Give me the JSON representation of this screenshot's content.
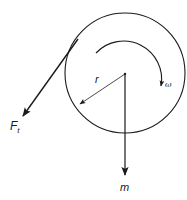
{
  "diagram": {
    "type": "free-body diagram of rotating pulley",
    "colors": {
      "stroke": "#1a1a1a",
      "background": "#ffffff"
    },
    "labels": {
      "tangential_force": "F",
      "tangential_force_subscript": "t",
      "radius": "r",
      "angular_velocity": "ω",
      "mass": "m"
    },
    "elements": [
      {
        "id": "pulley-disc",
        "shape": "circle",
        "center": [
          125,
          73
        ],
        "radius": 60
      },
      {
        "id": "center-point",
        "shape": "dot",
        "at": [
          125,
          74
        ]
      },
      {
        "id": "rotation-arc",
        "shape": "arc-arrow",
        "direction": "clockwise",
        "label": "ω"
      },
      {
        "id": "radius-arrow",
        "shape": "arrow",
        "from": [
          125,
          74
        ],
        "to": [
          79,
          105
        ],
        "label": "r"
      },
      {
        "id": "tangential-force-arrow",
        "shape": "arrow",
        "from": [
          78,
          39
        ],
        "to": [
          22,
          117
        ],
        "label": "F_t"
      },
      {
        "id": "weight-arrow",
        "shape": "arrow",
        "from": [
          125,
          74
        ],
        "to": [
          125,
          176
        ],
        "label": "m"
      }
    ]
  }
}
